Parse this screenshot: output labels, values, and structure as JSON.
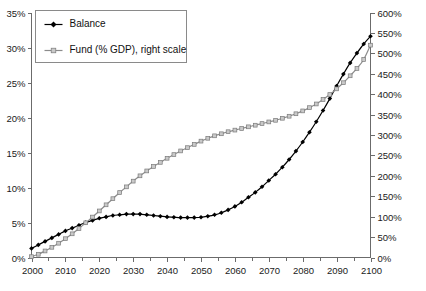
{
  "chart_data": {
    "type": "line",
    "title": "",
    "subtitle": "",
    "xlabel": "",
    "ylabel": "",
    "y2label": "",
    "grid": false,
    "legend_position": "top-left",
    "xlim": [
      2000,
      2100
    ],
    "ylim": [
      0,
      35
    ],
    "y2lim": [
      0,
      600
    ],
    "x_tick_labels": [
      "2000",
      "2010",
      "2020",
      "2030",
      "2040",
      "2050",
      "2060",
      "2070",
      "2080",
      "2090",
      "2100"
    ],
    "x_ticks": [
      2000,
      2010,
      2020,
      2030,
      2040,
      2050,
      2060,
      2070,
      2080,
      2090,
      2100
    ],
    "x_minor_ticks": [
      2005,
      2015,
      2025,
      2035,
      2045,
      2055,
      2065,
      2075,
      2085,
      2095
    ],
    "y_tick_labels": [
      "0%",
      "5%",
      "10%",
      "15%",
      "20%",
      "25%",
      "30%",
      "35%"
    ],
    "y_ticks": [
      0,
      5,
      10,
      15,
      20,
      25,
      30,
      35
    ],
    "y2_tick_labels": [
      "0%",
      "50%",
      "100%",
      "150%",
      "200%",
      "250%",
      "300%",
      "350%",
      "400%",
      "450%",
      "500%",
      "550%",
      "600%"
    ],
    "y2_ticks": [
      0,
      50,
      100,
      150,
      200,
      250,
      300,
      350,
      400,
      450,
      500,
      550,
      600
    ],
    "x": [
      2000,
      2002,
      2004,
      2006,
      2008,
      2010,
      2012,
      2014,
      2016,
      2018,
      2020,
      2022,
      2024,
      2026,
      2028,
      2030,
      2032,
      2034,
      2036,
      2038,
      2040,
      2042,
      2044,
      2046,
      2048,
      2050,
      2052,
      2054,
      2056,
      2058,
      2060,
      2062,
      2064,
      2066,
      2068,
      2070,
      2072,
      2074,
      2076,
      2078,
      2080,
      2082,
      2084,
      2086,
      2088,
      2090,
      2092,
      2094,
      2096,
      2098,
      2100
    ],
    "series": [
      {
        "name": "Balance",
        "axis": "left",
        "color": "#000000",
        "marker": "diamond",
        "units": "% of GDP",
        "values": [
          1.3,
          1.8,
          2.3,
          2.8,
          3.3,
          3.8,
          4.2,
          4.6,
          5.0,
          5.3,
          5.6,
          5.8,
          6.0,
          6.1,
          6.2,
          6.2,
          6.2,
          6.1,
          6.0,
          5.9,
          5.8,
          5.75,
          5.7,
          5.7,
          5.7,
          5.75,
          5.9,
          6.1,
          6.4,
          6.8,
          7.3,
          7.9,
          8.6,
          9.3,
          10.1,
          11.0,
          11.9,
          12.9,
          14.0,
          15.2,
          16.5,
          17.9,
          19.4,
          21.0,
          22.7,
          24.5,
          26.2,
          27.8,
          29.2,
          30.5,
          31.6
        ]
      },
      {
        "name": "Fund (% GDP), right scale",
        "axis": "right",
        "color": "#8c8c8c",
        "marker": "square",
        "units": "% of GDP",
        "values": [
          2,
          8,
          16,
          25,
          35,
          46,
          58,
          71,
          85,
          99,
          114,
          129,
          144,
          159,
          173,
          187,
          200,
          212,
          223,
          233,
          243,
          252,
          261,
          269,
          277,
          285,
          292,
          298,
          303,
          308,
          312,
          316,
          320,
          324,
          328,
          332,
          336,
          341,
          346,
          352,
          359,
          367,
          376,
          387,
          399,
          413,
          428,
          445,
          463,
          485,
          520
        ]
      }
    ],
    "annotations": []
  },
  "legend": {
    "entries": [
      {
        "label": "Balance",
        "marker": "diamond-marker",
        "color": "#000000"
      },
      {
        "label": "Fund (% GDP), right scale",
        "marker": "square-marker",
        "color": "#8c8c8c"
      }
    ]
  },
  "colors": {
    "balance": "#000000",
    "fund": "#8c8c8c",
    "axis": "#6b6b6b",
    "text": "#1a1a1a",
    "background": "#ffffff"
  }
}
